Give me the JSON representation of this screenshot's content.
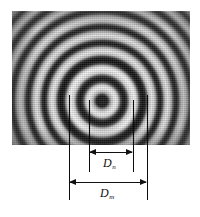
{
  "figure": {
    "name": "newtons-rings-diagram",
    "caption": "",
    "photo": {
      "name": "newtons-rings-interferogram",
      "description": "concentric circular interference fringes",
      "center_x": 104,
      "center_y": 77,
      "bounds": {
        "left": 12,
        "top": 11,
        "width": 178,
        "height": 134
      },
      "background_color": "#9a9a9a",
      "fringe_dark_color": "#141414",
      "fringe_light_color": "#ededed"
    },
    "leader_lines": [
      {
        "name": "leader-line-outer-left",
        "x": 69,
        "top": 95,
        "bottom": 200
      },
      {
        "name": "leader-line-inner-left",
        "x": 89,
        "top": 100,
        "bottom": 172
      },
      {
        "name": "leader-line-inner-right",
        "x": 133,
        "top": 100,
        "bottom": 172
      },
      {
        "name": "leader-line-outer-right",
        "x": 147,
        "top": 95,
        "bottom": 200
      }
    ],
    "dimensions": [
      {
        "name": "dimension-inner",
        "label": "D",
        "subscript": "n",
        "x_start": 89,
        "x_end": 133,
        "y": 152,
        "label_x": 104,
        "label_y": 157
      },
      {
        "name": "dimension-outer",
        "label": "D",
        "subscript": "m",
        "x_start": 69,
        "x_end": 147,
        "y": 182,
        "label_x": 101,
        "label_y": 187
      }
    ],
    "line_color": "#111111"
  }
}
